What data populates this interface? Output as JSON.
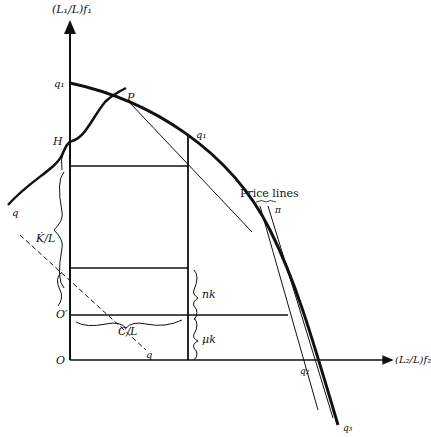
{
  "diagram": {
    "y_axis_label": "(L₁/L)f₁",
    "x_axis_label": "(L₂/L)f₂",
    "points": {
      "q_top": "q₁",
      "P": "P",
      "H": "H",
      "q1": "q₁",
      "q2": "q₂",
      "q3": "q₃",
      "O": "O",
      "O_prime": "O′",
      "q_left": "q",
      "q_bottom": "q"
    },
    "brackets": {
      "K_over_L": "K̇/L",
      "C_over_L": "C/L",
      "nk": "nk",
      "mu_k": "μk"
    },
    "price_lines_label": "Price lines",
    "pi_label": "π"
  }
}
